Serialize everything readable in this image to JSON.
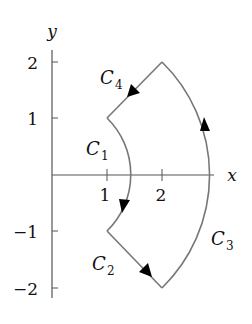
{
  "diagram": {
    "axes": {
      "x_label": "x",
      "y_label": "y",
      "x_ticks": [
        "1",
        "2"
      ],
      "y_ticks": [
        "2",
        "1",
        "−1",
        "−2"
      ]
    },
    "curves": [
      {
        "name": "C1",
        "label_base": "C",
        "label_sub": "1",
        "description": "inner arc of radius √2 from (1,1) to (1,-1), arrow downward"
      },
      {
        "name": "C2",
        "label_base": "C",
        "label_sub": "2",
        "description": "segment from (1,-1) to (2,-2), arrow toward (2,-2)"
      },
      {
        "name": "C3",
        "label_base": "C",
        "label_sub": "3",
        "description": "outer arc of radius 2√2 from (2,-2) to (2,2), arrow upward"
      },
      {
        "name": "C4",
        "label_base": "C",
        "label_sub": "4",
        "description": "segment from (2,2) to (1,1), arrow toward (1,1)"
      }
    ],
    "colors": {
      "curve": "#777777",
      "axis": "#555555",
      "arrow": "#000000"
    }
  }
}
